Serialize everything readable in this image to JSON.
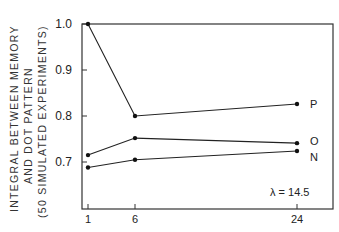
{
  "chart_data": {
    "type": "line",
    "title": "",
    "xlabel": "",
    "ylabel_lines": [
      "INTEGRAL BETWEEN MEMORY",
      "AND DOT PATTERN",
      "(50 SIMULATED EXPERIMENTS)"
    ],
    "ylabel": "INTEGRAL BETWEEN MEMORY AND DOT PATTERN (50 SIMULATED EXPERIMENTS)",
    "x": [
      1,
      6,
      24
    ],
    "x_tick_labels": [
      "1",
      "6",
      "24"
    ],
    "y_tick_labels": [
      "1.0",
      "0.9",
      "0.8",
      "0.7"
    ],
    "y_ticks": [
      1.0,
      0.9,
      0.8,
      0.7
    ],
    "ylim": [
      0.6,
      1.0
    ],
    "grid": false,
    "legend_position": "inline-right",
    "annotation": "λ = 14.5",
    "series": [
      {
        "name": "P",
        "values": [
          1.0,
          0.8,
          0.826
        ]
      },
      {
        "name": "O",
        "values": [
          0.715,
          0.752,
          0.741
        ]
      },
      {
        "name": "N",
        "values": [
          0.688,
          0.705,
          0.724
        ]
      }
    ]
  },
  "annotation_text": "λ = 14.5"
}
